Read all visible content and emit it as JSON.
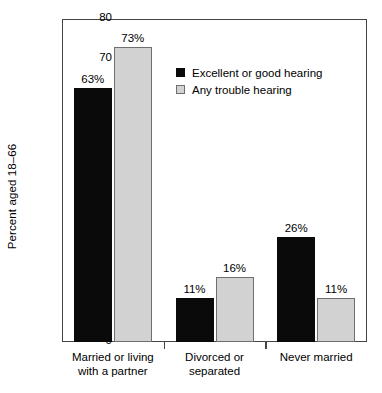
{
  "chart_data": {
    "type": "bar",
    "title": "",
    "xlabel": "",
    "ylabel": "Percent aged 18–66",
    "ylim": [
      0,
      80
    ],
    "yticks": [
      0,
      10,
      20,
      30,
      40,
      50,
      60,
      70,
      80
    ],
    "ytick_labels": [
      "0",
      "10",
      "20",
      "30",
      "40",
      "50",
      "60",
      "70",
      "80"
    ],
    "grid": false,
    "legend_position": "upper center",
    "categories": [
      "Married or living with a partner",
      "Divorced or separated",
      "Never married"
    ],
    "category_lines": [
      [
        "Married or living",
        "with a partner"
      ],
      [
        "Divorced or",
        "separated"
      ],
      [
        "Never married"
      ]
    ],
    "series": [
      {
        "name": "Excellent or good hearing",
        "color": "#0a0a0a",
        "values": [
          63,
          11,
          26
        ],
        "labels": [
          "63%",
          "11%",
          "26%"
        ]
      },
      {
        "name": "Any trouble hearing",
        "color": "#d2d2d2",
        "values": [
          73,
          16,
          11
        ],
        "labels": [
          "73%",
          "16%",
          "11%"
        ]
      }
    ]
  },
  "legend": {
    "items": [
      {
        "label": "Excellent or good hearing",
        "swatch": "dark"
      },
      {
        "label": "Any trouble hearing",
        "swatch": "light"
      }
    ]
  },
  "axis": {
    "y_title": "Percent aged 18–66"
  }
}
